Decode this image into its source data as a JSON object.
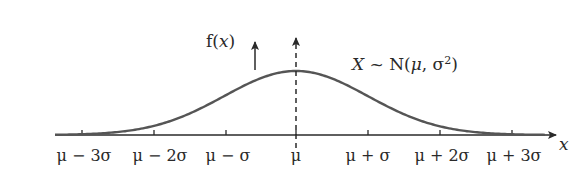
{
  "chart_data": {
    "type": "line",
    "title": "",
    "distribution_label": "X ~ N(μ, σ²)",
    "ylabel": "f(x)",
    "xlabel": "x",
    "tick_labels": [
      "μ − 3σ",
      "μ − 2σ",
      "μ − σ",
      "μ",
      "μ + σ",
      "μ + 2σ",
      "μ + 3σ"
    ],
    "x": [
      -3,
      -2,
      -1,
      0,
      1,
      2,
      3
    ],
    "curve": "normal density, peak at μ",
    "mean_line": "dashed vertical line at μ with arrow",
    "grid": false
  },
  "labels": {
    "fx": "f(",
    "fx_var": "x",
    "fx_close": ")",
    "dist_X": "X",
    "dist_rest": " ~ N(",
    "dist_mu": "μ",
    "dist_sigma": ", σ",
    "dist_sup": "2",
    "dist_close": ")",
    "x_axis": "x",
    "ticks": [
      "μ − 3σ",
      "μ − 2σ",
      "μ − σ",
      "μ",
      "μ + σ",
      "μ + 2σ",
      "μ + 3σ"
    ]
  },
  "colors": {
    "curve": "#555555",
    "axis": "#2a2a2a"
  }
}
